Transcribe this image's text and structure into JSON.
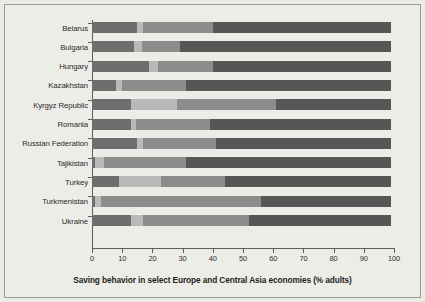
{
  "chart_data": {
    "type": "bar",
    "orientation": "horizontal",
    "stacked": true,
    "title": "Saving behavior in select Europe and Central Asia economies (% adults)",
    "xlabel": "",
    "ylabel": "",
    "xlim": [
      0,
      100
    ],
    "xticks": [
      0,
      10,
      20,
      30,
      40,
      50,
      60,
      70,
      80,
      90,
      100
    ],
    "xticklabels": [
      "0",
      "10",
      "20",
      "30",
      "40",
      "50",
      "60",
      "70",
      "80",
      "90",
      "100"
    ],
    "grid": false,
    "legend": "none",
    "categories": [
      "Belarus",
      "Bulgaria",
      "Hungary",
      "Kazakhstan",
      "Kyrgyz Republic",
      "Romania",
      "Russian Federation",
      "Tajikistan",
      "Turkey",
      "Turkmenistan",
      "Ukraine"
    ],
    "series": [
      {
        "name": "segment-1",
        "color": "#6e6e6e",
        "values": [
          15.0,
          14.0,
          19.0,
          8.0,
          13.0,
          13.0,
          15.0,
          1.0,
          9.0,
          1.0,
          13.0
        ]
      },
      {
        "name": "segment-2",
        "color": "#b9b9b9",
        "values": [
          2.0,
          2.5,
          3.0,
          2.0,
          15.0,
          1.5,
          2.0,
          3.0,
          14.0,
          2.0,
          4.0
        ]
      },
      {
        "name": "segment-3",
        "color": "#8c8c8c",
        "values": [
          23.0,
          12.5,
          18.0,
          21.0,
          33.0,
          24.5,
          24.0,
          27.0,
          21.0,
          53.0,
          35.0
        ]
      },
      {
        "name": "segment-4",
        "color": "#565656",
        "values": [
          59.0,
          70.0,
          59.0,
          68.0,
          38.0,
          60.0,
          58.0,
          68.0,
          55.0,
          43.0,
          47.0
        ]
      }
    ],
    "cumulative_totals": [
      99,
      99,
      99,
      99,
      99,
      99,
      99,
      99,
      99,
      99,
      99
    ]
  },
  "figure": {
    "background_color": "#ecece7",
    "frame_color": "#9a9a95",
    "axis_color": "#5d5d5d",
    "text_color": "#2a2a2a"
  }
}
